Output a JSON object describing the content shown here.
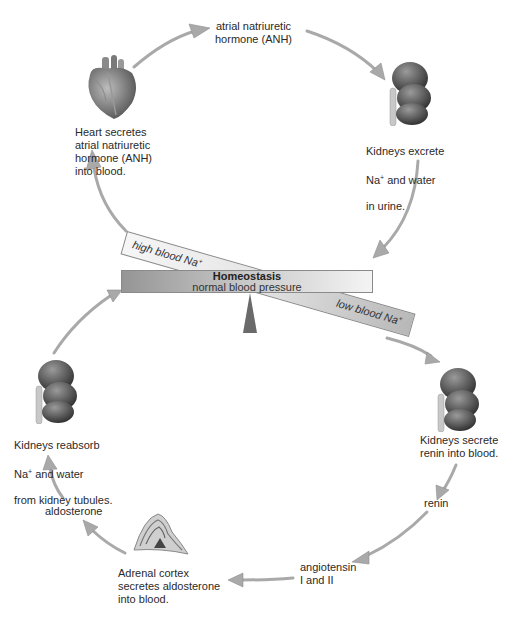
{
  "diagram": {
    "type": "feedback-cycle",
    "center": {
      "title": "Homeostasis",
      "subtitle": "normal blood pressure",
      "high_label": "high blood Na",
      "low_label": "low blood Na",
      "superscript": "+"
    },
    "upper_cycle": {
      "heart_label": "Heart secretes\natrial natriuretic\nhormone (ANH)\ninto blood.",
      "hormone_label": "atrial natriuretic\nhormone (ANH)",
      "kidney_label_line1": "Kidneys excrete",
      "kidney_label_line2a": "Na",
      "kidney_label_line2b": "  and water",
      "kidney_label_line3": "in urine."
    },
    "lower_cycle": {
      "kidney_secrete_label": "Kidneys secrete\nrenin into blood.",
      "renin_label": "renin",
      "angiotensin_label": "angiotensin\nI and II",
      "adrenal_label": "Adrenal cortex\nsecretes aldosterone\ninto blood.",
      "aldosterone_label": "aldosterone",
      "kidney_reabsorb_line1": "Kidneys reabsorb",
      "kidney_reabsorb_line2a": "Na",
      "kidney_reabsorb_line2b": "  and water",
      "kidney_reabsorb_line3": "from kidney tubules."
    },
    "colors": {
      "arrow": "#a9a9a9",
      "beam_dark": "#9a9a9a",
      "beam_light": "#f2f2f2",
      "fulcrum": "#6a6a6a",
      "organ": "#5a5a5a"
    }
  }
}
